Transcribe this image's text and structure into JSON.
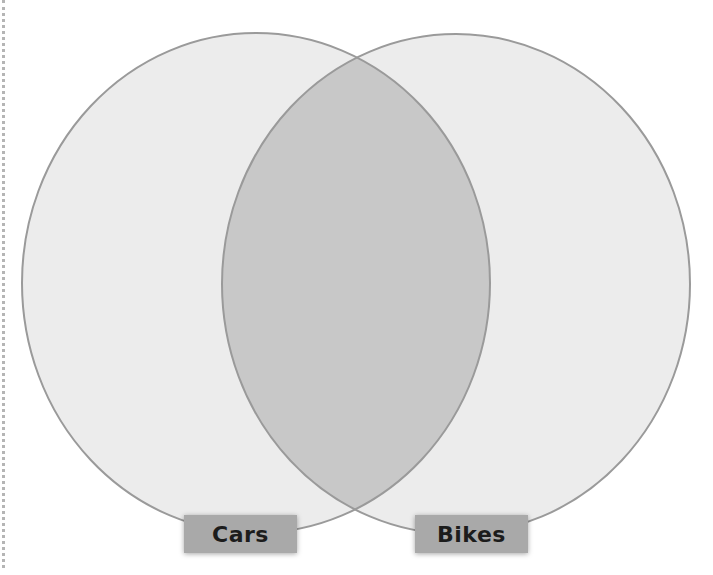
{
  "diagram": {
    "type": "venn",
    "sets": [
      {
        "name": "Cars",
        "label": "Cars"
      },
      {
        "name": "Bikes",
        "label": "Bikes"
      }
    ],
    "intersection": {
      "sets": [
        "Cars",
        "Bikes"
      ],
      "label": ""
    },
    "colors": {
      "set_fill": "#ececec",
      "overlap_fill": "#c8c8c8",
      "stroke": "#9a9a9a",
      "label_bg": "#a9a9a9",
      "label_text": "#1c1c1c"
    }
  }
}
